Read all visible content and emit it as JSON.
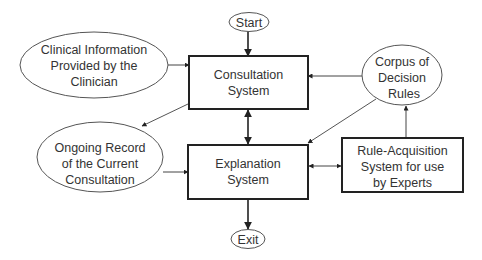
{
  "diagram": {
    "type": "flowchart",
    "colors": {
      "background": "#ffffff",
      "stroke": "#222222",
      "text": "#333333"
    },
    "nodes": {
      "start": {
        "shape": "ellipse",
        "lines": [
          "Start"
        ]
      },
      "clinical_info": {
        "shape": "ellipse",
        "lines": [
          "Clinical Information",
          "Provided by the",
          "Clinician"
        ]
      },
      "consultation": {
        "shape": "box",
        "lines": [
          "Consultation",
          "System"
        ]
      },
      "corpus": {
        "shape": "ellipse",
        "lines": [
          "Corpus of",
          "Decision",
          "Rules"
        ]
      },
      "ongoing_record": {
        "shape": "ellipse",
        "lines": [
          "Ongoing Record",
          "of the Current",
          "Consultation"
        ]
      },
      "explanation": {
        "shape": "box",
        "lines": [
          "Explanation",
          "System"
        ]
      },
      "rule_acquisition": {
        "shape": "box",
        "lines": [
          "Rule-Acquisition",
          "System for use",
          "by Experts"
        ]
      },
      "exit": {
        "shape": "ellipse",
        "lines": [
          "Exit"
        ]
      }
    },
    "edges": [
      {
        "from": "start",
        "to": "consultation",
        "style": "single"
      },
      {
        "from": "clinical_info",
        "to": "consultation",
        "style": "single"
      },
      {
        "from": "corpus",
        "to": "consultation",
        "style": "single"
      },
      {
        "from": "consultation",
        "to": "ongoing_record",
        "style": "single"
      },
      {
        "from": "consultation",
        "to": "explanation",
        "style": "double"
      },
      {
        "from": "ongoing_record",
        "to": "explanation",
        "style": "single"
      },
      {
        "from": "corpus",
        "to": "explanation",
        "style": "single"
      },
      {
        "from": "explanation",
        "to": "rule_acquisition",
        "style": "double"
      },
      {
        "from": "rule_acquisition",
        "to": "corpus",
        "style": "single"
      },
      {
        "from": "explanation",
        "to": "exit",
        "style": "single"
      }
    ]
  }
}
